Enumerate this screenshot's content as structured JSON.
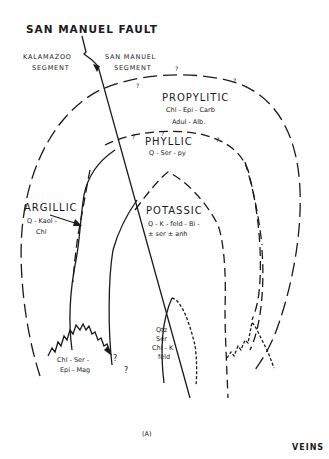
{
  "title": "SAN MANUEL FAULT",
  "segments": {
    "left_line1": "KALAMAZOO",
    "left_line2": "SEGMENT",
    "right_line1": "SAN  MANUEL",
    "right_line2": "SEGMENT"
  },
  "zones": {
    "propylitic": {
      "name": "PROPYLITIC",
      "minerals": "Chl - Epi - Carb"
    },
    "adularia": {
      "minerals": "Adul - Alb."
    },
    "phyllic": {
      "name": "PHYLLIC",
      "minerals": "Q - Ser - py"
    },
    "argillic": {
      "name": "ARGILLIC",
      "minerals_line1": "Q - Kaol -",
      "minerals_line2": "Chl"
    },
    "potassic": {
      "name": "POTASSIC",
      "minerals_line1": "Q - K - feld - Bi -",
      "minerals_line2": "± ser ± anh"
    },
    "chl_ser": {
      "line1": "Chl - Ser -",
      "line2": "Epi - Mag"
    },
    "qtz_ser": {
      "line1": "Qtz",
      "line2": "Ser",
      "line3": "Chl - K",
      "line4": "feld"
    }
  },
  "uncertainty_mark": "?",
  "panel_label": "(A)",
  "veins_label": "VEINS"
}
